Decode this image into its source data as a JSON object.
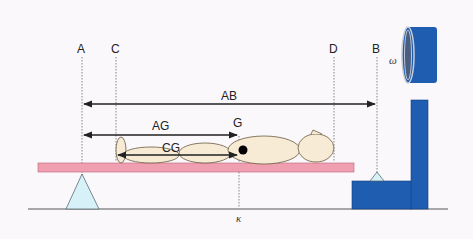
{
  "diagram": {
    "labels": {
      "A": "A",
      "B": "B",
      "C": "C",
      "D": "D",
      "G": "G",
      "AB": "AB",
      "AG": "AG",
      "CG": "CG",
      "omega": "ω",
      "kappa": "κ"
    },
    "colors": {
      "background": "#fbf8fc",
      "board": "#ef9fb0",
      "board_stroke": "#b86478",
      "fulcrum": "#d6f1f7",
      "scale": "#1f5db0",
      "scale_dark": "#133f80",
      "body": "#f7ebd5",
      "body_stroke": "#6a5a40",
      "line": "#222222"
    }
  }
}
